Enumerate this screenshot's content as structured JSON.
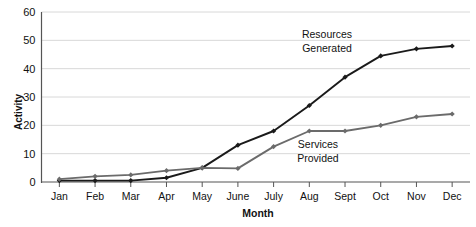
{
  "chart_data": {
    "type": "line",
    "title": "",
    "xlabel": "Month",
    "ylabel": "Activity",
    "categories": [
      "Jan",
      "Feb",
      "Mar",
      "Apr",
      "May",
      "June",
      "July",
      "Aug",
      "Sept",
      "Oct",
      "Nov",
      "Dec"
    ],
    "ylim": [
      0,
      60
    ],
    "yticks": [
      0,
      10,
      20,
      30,
      40,
      50,
      60
    ],
    "grid": true,
    "legend_position": "inline-annotations",
    "series": [
      {
        "name": "Resources Generated",
        "color": "#1a1a1a",
        "values": [
          0.5,
          0.5,
          0.5,
          1.5,
          5,
          13,
          18,
          27,
          37,
          44.5,
          47,
          48
        ],
        "annotation": {
          "line1": "Resources",
          "line2": "Generated"
        }
      },
      {
        "name": "Services Provided",
        "color": "#6b6b6b",
        "values": [
          1,
          2,
          2.5,
          4,
          5,
          4.8,
          12.5,
          18,
          18,
          20,
          23,
          24
        ],
        "annotation": {
          "line1": "Services",
          "line2": "Provided"
        }
      }
    ],
    "colors": {
      "grid": "#d8d8d8",
      "axis": "#555555",
      "text": "#111111"
    }
  }
}
